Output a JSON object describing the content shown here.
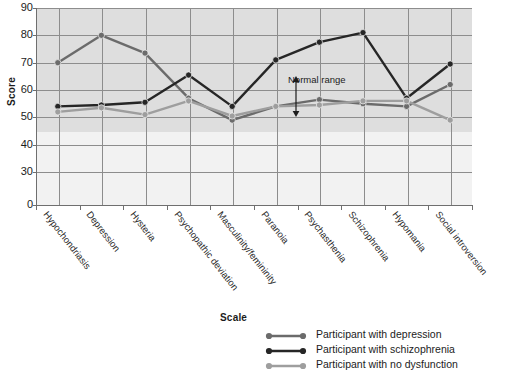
{
  "chart_data": {
    "type": "line",
    "title": "",
    "xlabel": "",
    "ylabel": "Score",
    "ylim": [
      0,
      90
    ],
    "yticks": [
      0,
      30,
      40,
      50,
      60,
      70,
      80,
      90
    ],
    "y_axis_break": true,
    "grid": true,
    "legend_position": "bottom",
    "legend_title": "Scale",
    "categories": [
      "Hypochondriasis",
      "Depression",
      "Hysteria",
      "Psychopathic deviation",
      "Masculinity/femininity",
      "Paranoia",
      "Psychasthenia",
      "Schizophrenia",
      "Hypomania",
      "Social introversion"
    ],
    "series": [
      {
        "name": "Participant with depression",
        "color": "#6b6b6b",
        "values": [
          70,
          80,
          73.5,
          57,
          49,
          54,
          56.5,
          55,
          54,
          62
        ]
      },
      {
        "name": "Participant with schizophrenia",
        "color": "#262626",
        "values": [
          54,
          54.5,
          55.5,
          65.5,
          54,
          71,
          77.5,
          81,
          57,
          69.5
        ]
      },
      {
        "name": "Participant with no dysfunction",
        "color": "#9e9e9e",
        "values": [
          52,
          53.5,
          51,
          56,
          50.5,
          54,
          54.5,
          56,
          56,
          49
        ]
      }
    ],
    "annotations": [
      {
        "text": "Normal range",
        "kind": "double-arrow-vertical",
        "y_from": 50,
        "y_to": 65
      }
    ]
  },
  "axis": {
    "y_title": "Score",
    "y_tick_labels": [
      "90",
      "80",
      "70",
      "60",
      "50",
      "40",
      "30",
      "0"
    ]
  },
  "annotation": {
    "normal_range_label": "Normal range"
  },
  "legend": {
    "title": "Scale",
    "items": [
      {
        "label": "Participant with depression",
        "color": "#6b6b6b"
      },
      {
        "label": "Participant with schizophrenia",
        "color": "#262626"
      },
      {
        "label": "Participant with no dysfunction",
        "color": "#9e9e9e"
      }
    ]
  }
}
